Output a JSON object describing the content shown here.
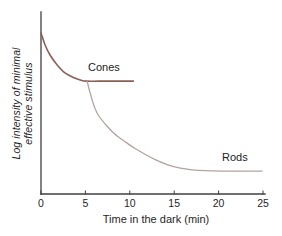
{
  "figure": {
    "background": "#ffffff"
  },
  "chart_data": {
    "type": "line",
    "title": "",
    "xlabel": "Time in the dark (min)",
    "ylabel": "Log intensity of minimal effective stimulus",
    "ylabel_line1": "Log intensity of minimal",
    "ylabel_line2": "effective stimulus",
    "x_ticks": [
      0,
      5,
      10,
      15,
      20,
      25
    ],
    "xlim": [
      0,
      25
    ],
    "ylim": [
      0,
      10
    ],
    "y_ticks": [],
    "grid": false,
    "legend_position": "inline-labels",
    "axis_color": "#3f3f3f",
    "plot_area": {
      "left": 41,
      "top": 12,
      "right": 263,
      "bottom": 194
    },
    "series": [
      {
        "name": "Cones",
        "color": "#8a5f55",
        "stroke_width": 1.6,
        "points": [
          [
            0,
            8.85
          ],
          [
            0.45,
            8.2
          ],
          [
            1.0,
            7.65
          ],
          [
            1.8,
            7.1
          ],
          [
            2.7,
            6.65
          ],
          [
            3.8,
            6.37
          ],
          [
            4.7,
            6.22
          ],
          [
            5.2,
            6.2
          ],
          [
            6.5,
            6.2
          ],
          [
            8.5,
            6.2
          ],
          [
            10.4,
            6.2
          ]
        ]
      },
      {
        "name": "Rods",
        "color": "#b4a39d",
        "stroke_width": 1.3,
        "points": [
          [
            5.2,
            6.2
          ],
          [
            5.45,
            5.7
          ],
          [
            6.0,
            4.8
          ],
          [
            6.5,
            4.3
          ],
          [
            7.4,
            3.75
          ],
          [
            8.3,
            3.3
          ],
          [
            9.4,
            2.9
          ],
          [
            10.6,
            2.5
          ],
          [
            12.8,
            1.9
          ],
          [
            14.2,
            1.62
          ],
          [
            15.7,
            1.42
          ],
          [
            17.0,
            1.33
          ],
          [
            18.5,
            1.28
          ],
          [
            20.5,
            1.26
          ],
          [
            22.5,
            1.26
          ],
          [
            24.9,
            1.26
          ]
        ]
      }
    ]
  }
}
